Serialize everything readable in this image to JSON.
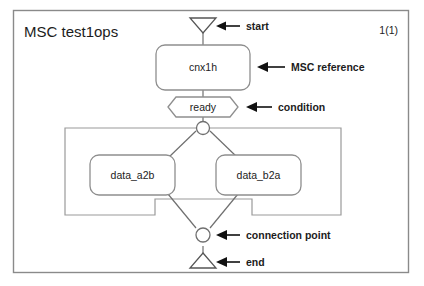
{
  "diagram": {
    "type": "msc-high-level-flow",
    "title": "MSC test1ops",
    "page_indicator": "1(1)",
    "colors": {
      "frame_border": "#8a8a8a",
      "node_border": "#8e8e8e",
      "connector": "#6f6f6f",
      "text": "#1c1c1c",
      "annotation_arrow": "#111111",
      "background": "#ffffff"
    },
    "nodes": [
      {
        "id": "start",
        "kind": "start-symbol",
        "shape": "triangle-down",
        "label": ""
      },
      {
        "id": "msc-reference",
        "kind": "msc-reference",
        "shape": "rounded-rect",
        "label": "cnx1h"
      },
      {
        "id": "condition",
        "kind": "condition",
        "shape": "hexagon",
        "label": "ready"
      },
      {
        "id": "connection-point-top",
        "kind": "connection-point",
        "shape": "circle",
        "label": ""
      },
      {
        "id": "data-a2b",
        "kind": "msc-reference",
        "shape": "rounded-rect",
        "label": "data_a2b"
      },
      {
        "id": "data-b2a",
        "kind": "msc-reference",
        "shape": "rounded-rect",
        "label": "data_b2a"
      },
      {
        "id": "connection-point-bottom",
        "kind": "connection-point",
        "shape": "circle",
        "label": ""
      },
      {
        "id": "end",
        "kind": "end-symbol",
        "shape": "triangle-up",
        "label": ""
      },
      {
        "id": "parallel-frame",
        "kind": "parallel-frame",
        "shape": "notched-rect",
        "label": ""
      }
    ],
    "annotations": [
      {
        "id": "start",
        "label": "start",
        "target": "start"
      },
      {
        "id": "msc-reference",
        "label": "MSC reference",
        "target": "msc-reference"
      },
      {
        "id": "condition",
        "label": "condition",
        "target": "condition"
      },
      {
        "id": "connection-point",
        "label": "connection point",
        "target": "connection-point-bottom"
      },
      {
        "id": "end",
        "label": "end",
        "target": "end"
      }
    ]
  }
}
